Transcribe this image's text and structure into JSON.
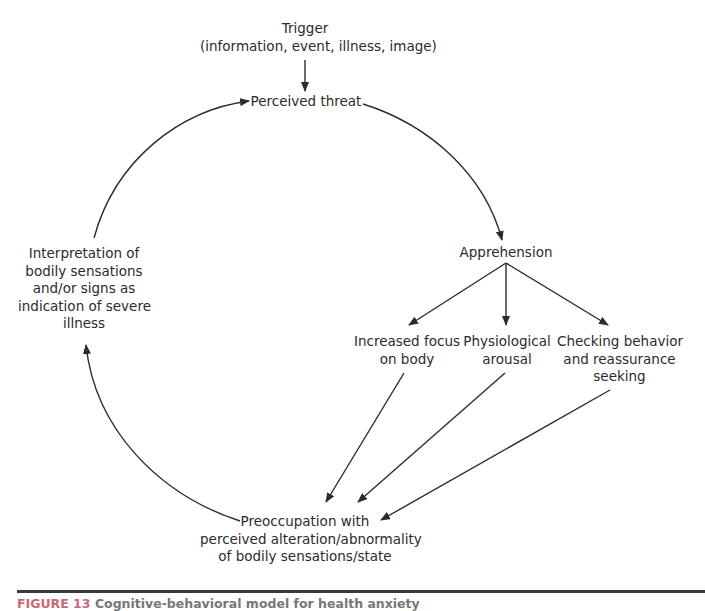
{
  "diagram": {
    "nodes": {
      "trigger": {
        "lines": [
          "Trigger",
          "(information, event, illness, image)"
        ]
      },
      "perceived_threat": {
        "lines": [
          "Perceived threat"
        ]
      },
      "apprehension": {
        "lines": [
          "Apprehension"
        ]
      },
      "increased_focus": {
        "lines": [
          "Increased focus",
          "on body"
        ]
      },
      "physiological_arousal": {
        "lines": [
          "Physiological",
          "arousal"
        ]
      },
      "checking_behavior": {
        "lines": [
          "Checking behavior",
          "and reassurance",
          "seeking"
        ]
      },
      "preoccupation": {
        "lines": [
          "Preoccupation with",
          "perceived alteration/abnormality",
          "of bodily sensations/state"
        ]
      },
      "interpretation": {
        "lines": [
          "Interpretation of",
          "bodily sensations",
          "and/or signs as",
          "indication of severe",
          "illness"
        ]
      }
    },
    "edges": [
      {
        "from": "trigger",
        "to": "perceived_threat"
      },
      {
        "from": "perceived_threat",
        "to": "apprehension"
      },
      {
        "from": "apprehension",
        "to": "increased_focus"
      },
      {
        "from": "apprehension",
        "to": "physiological_arousal"
      },
      {
        "from": "apprehension",
        "to": "checking_behavior"
      },
      {
        "from": "increased_focus",
        "to": "preoccupation"
      },
      {
        "from": "physiological_arousal",
        "to": "preoccupation"
      },
      {
        "from": "checking_behavior",
        "to": "preoccupation"
      },
      {
        "from": "preoccupation",
        "to": "interpretation"
      },
      {
        "from": "interpretation",
        "to": "perceived_threat"
      }
    ],
    "line_color": "#2b2b2b"
  },
  "caption": {
    "label": "FIGURE 13",
    "text": "Cognitive-behavioral model for health anxiety"
  }
}
